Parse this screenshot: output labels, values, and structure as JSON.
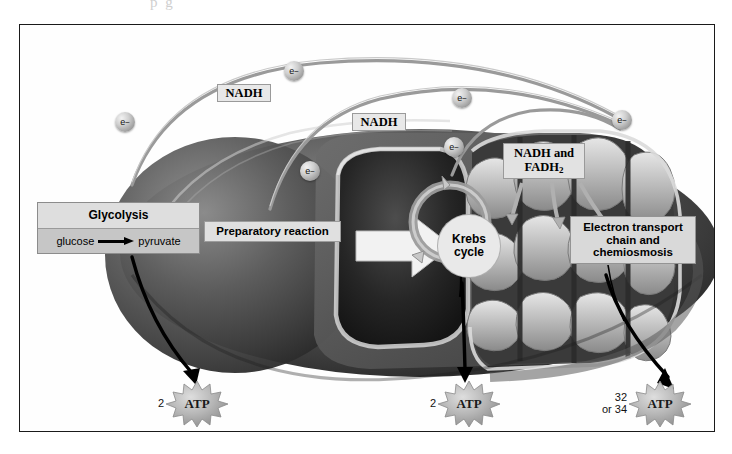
{
  "figure": {
    "page_artifact_text": "p g"
  },
  "labels": {
    "glycolysis": {
      "title": "Glycolysis",
      "reactant": "glucose",
      "arrow_icon": "right-arrow",
      "product": "pyruvate"
    },
    "preparatory_reaction": "Preparatory reaction",
    "krebs_cycle": "Krebs\ncycle",
    "krebs_cycle_line1": "Krebs",
    "krebs_cycle_line2": "cycle",
    "electron_transport": "Electron transport\nchain and\nchemiosmosis",
    "etc_line1": "Electron transport",
    "etc_line2": "chain and",
    "etc_line3": "chemiosmosis",
    "nadh_1": "NADH",
    "nadh_2": "NADH",
    "nadh_and_fadh2_line1": "NADH and",
    "nadh_and_fadh2_line2": "FADH",
    "nadh_and_fadh2_sub": "2"
  },
  "electrons": [
    {
      "id": "e1",
      "label": "e",
      "charge": "−",
      "x": 105,
      "y": 97
    },
    {
      "id": "e2",
      "label": "e",
      "charge": "−",
      "x": 274,
      "y": 45
    },
    {
      "id": "e3",
      "label": "e",
      "charge": "−",
      "x": 442,
      "y": 72
    },
    {
      "id": "e4",
      "label": "e",
      "charge": "−",
      "x": 602,
      "y": 94
    },
    {
      "id": "e5",
      "label": "e",
      "charge": "−",
      "x": 290,
      "y": 145
    },
    {
      "id": "e6",
      "label": "e",
      "charge": "−",
      "x": 434,
      "y": 121
    }
  ],
  "atp_outputs": [
    {
      "id": "atp-glycolysis",
      "count": "2",
      "label": "ATP"
    },
    {
      "id": "atp-krebs",
      "count": "2",
      "label": "ATP"
    },
    {
      "id": "atp-etc",
      "count": "32\nor 34",
      "label": "ATP"
    }
  ],
  "colors": {
    "frame_border": "#1a1a1a",
    "label_fill": "#dcdcdc",
    "label_border": "#8e8e8e",
    "mitochondrion_outer": "#4a4a4a",
    "mitochondrion_inner": "#2a2a2a",
    "cristae_light": "#d8d8d8",
    "atp_burst": "#b3b3b3",
    "electron_sphere": "#b4b4b4",
    "arrow_black": "#000000"
  }
}
